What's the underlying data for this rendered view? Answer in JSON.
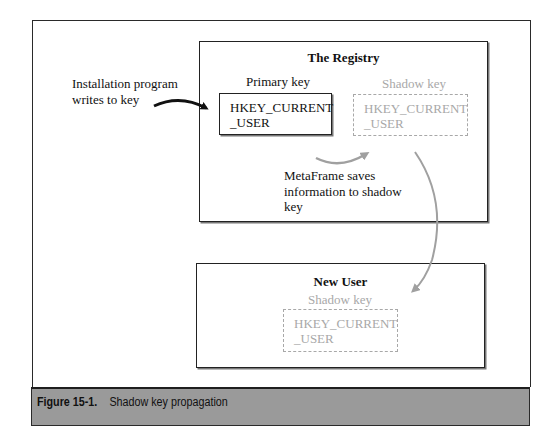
{
  "diagram": {
    "registry": {
      "title": "The Registry",
      "primary_key": {
        "label": "Primary key",
        "line1": "HKEY_CURRENT",
        "line2": "_USER"
      },
      "shadow_key": {
        "label": "Shadow key",
        "line1": "HKEY_CURRENT",
        "line2": "_USER"
      }
    },
    "new_user": {
      "title": "New User",
      "shadow_key": {
        "label": "Shadow key",
        "line1": "HKEY_CURRENT",
        "line2": "_USER"
      }
    },
    "annotations": {
      "install_line1": "Installation program",
      "install_line2": "writes to key",
      "metaframe_line1": "MetaFrame saves",
      "metaframe_line2": "information to shadow",
      "metaframe_line3": "key"
    },
    "colors": {
      "frame": "#2a2a2a",
      "shadow_gray": "#a8a8a8",
      "arrow_black": "#111111",
      "arrow_gray": "#a0a0a0",
      "caption_bg": "#9a9a9a"
    }
  },
  "caption": {
    "figure_number": "Figure 15-1.",
    "text": "Shadow key propagation"
  }
}
